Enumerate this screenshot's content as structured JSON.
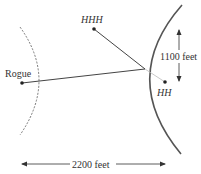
{
  "labels": {
    "rogue": "Rogue",
    "hhh": "HHH",
    "hh": "HH",
    "vertical_distance": "1100 feet",
    "horizontal_distance": "2200 feet"
  },
  "colors": {
    "line": "#444444",
    "curve": "#555555",
    "dashed": "#777777",
    "text": "#333333"
  }
}
